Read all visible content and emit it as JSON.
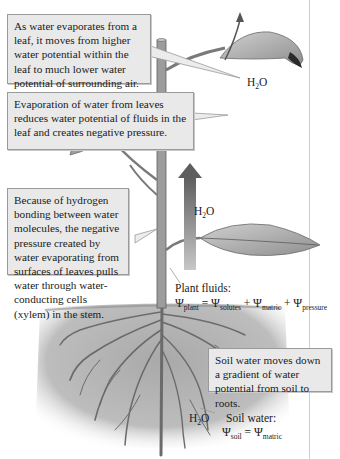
{
  "callouts": {
    "evaporation_leaf": "As water evaporates from a leaf, it moves from higher water potential within the leaf to much lower water potential of surrounding air.",
    "negative_pressure": "Evaporation of water from leaves reduces water potential of fluids in the leaf and creates negative pressure.",
    "hydrogen_bonding": "Because of hydrogen bonding between water molecules, the negative pressure created by water evaporating from surfaces of leaves pulls water through water-conducting cells (xylem) in the stem.",
    "soil_water": "Soil water moves down a gradient of water potential from soil to roots."
  },
  "labels": {
    "h2o_top": {
      "h": "H",
      "sub": "2",
      "o": "O"
    },
    "h2o_stem": {
      "h": "H",
      "sub": "2",
      "o": "O"
    },
    "h2o_soil": {
      "h": "H",
      "sub": "2",
      "o": "O"
    },
    "plant_fluids_title": "Plant fluids:",
    "plant_equation": {
      "psi": "Ψ",
      "lhs_sub": "plant",
      "eq": " = ",
      "t1_sub": "solutes",
      "plus": " + ",
      "t2_sub": "matric",
      "t3_sub": "pressure"
    },
    "soil_water_title": "Soil water:",
    "soil_equation": {
      "psi": "Ψ",
      "lhs_sub": "soil",
      "eq": " = ",
      "rhs_sub": "matric"
    }
  },
  "colors": {
    "box_fill": "#e9e9e9",
    "box_border": "#9a9a9a",
    "soil": "#b4b4b4",
    "leaf": "#a9a9a9",
    "stem": "#8a8a8a",
    "arrow": "#6f6f6f"
  }
}
